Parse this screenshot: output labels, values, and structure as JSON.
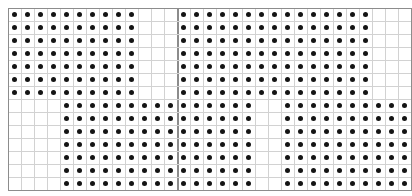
{
  "figure": {
    "width": 412,
    "height": 196,
    "background_color": "#ffffff"
  },
  "grid": {
    "origin_x": 8,
    "origin_y": 8,
    "cell_size": 13,
    "columns": 31,
    "rows": 14,
    "minor_line_color": "#d2d2d2",
    "major_line_color": "#8c8c8c",
    "border_color": "#8c8c8c",
    "major_vertical_columns": [
      13
    ],
    "major_horizontal_rows": []
  },
  "dots": {
    "color": "#141414",
    "diameter": 5,
    "shape": "circle"
  },
  "chart_data": {
    "type": "heatmap",
    "title": "",
    "subtitle": "",
    "xlabel": "",
    "ylabel": "",
    "grid": true,
    "legend": "none",
    "xlim": [
      0,
      31
    ],
    "ylim": [
      0,
      14
    ],
    "cell_states": [
      "empty",
      "dot"
    ],
    "blocks": [
      {
        "name": "top-left-block",
        "col_start": 0,
        "col_end": 9,
        "row_start": 0,
        "row_end": 6,
        "cols": 10,
        "rows": 7,
        "count": 70
      },
      {
        "name": "top-right-block",
        "col_start": 13,
        "col_end": 27,
        "row_start": 0,
        "row_end": 6,
        "cols": 15,
        "rows": 7,
        "count": 105
      },
      {
        "name": "bottom-middle-block",
        "col_start": 4,
        "col_end": 18,
        "row_start": 7,
        "row_end": 13,
        "cols": 15,
        "rows": 7,
        "count": 105
      },
      {
        "name": "bottom-right-block",
        "col_start": 21,
        "col_end": 30,
        "row_start": 7,
        "row_end": 13,
        "cols": 10,
        "rows": 7,
        "count": 70
      }
    ],
    "total_dots": 350
  }
}
